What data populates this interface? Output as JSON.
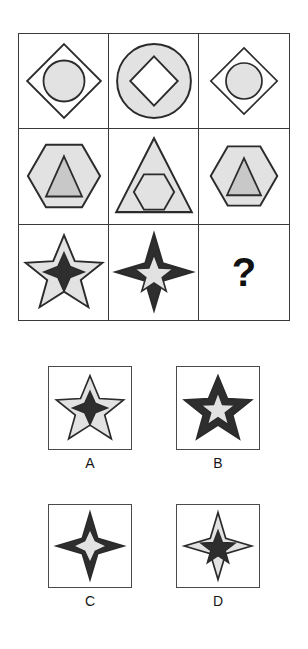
{
  "puzzle": {
    "type": "visual-analogy-matrix",
    "question_mark": "?",
    "palette": {
      "light_fill": "#e2e2e2",
      "mid_fill": "#c8c8c8",
      "dark_fill": "#2e2e2e",
      "white_fill": "#ffffff",
      "outline": "#2b2b2b",
      "grid_border": "#3a3a3a",
      "box_border": "#4a4a4a",
      "background": "#ffffff"
    },
    "matrix": {
      "rows": 3,
      "cols": 3,
      "cells": [
        {
          "id": "r1c1",
          "outer_shape": "diamond",
          "outer_fill": "white",
          "inner_shape": "circle",
          "inner_fill": "light",
          "size": "large",
          "description": "Large white diamond containing a light gray circle"
        },
        {
          "id": "r1c2",
          "outer_shape": "circle",
          "outer_fill": "light",
          "inner_shape": "diamond",
          "inner_fill": "white",
          "size": "large",
          "description": "Light gray circle containing a white diamond"
        },
        {
          "id": "r1c3",
          "outer_shape": "diamond",
          "outer_fill": "white",
          "inner_shape": "circle",
          "inner_fill": "light",
          "size": "medium",
          "description": "White diamond containing a light gray circle"
        },
        {
          "id": "r2c1",
          "outer_shape": "hexagon",
          "outer_fill": "light",
          "inner_shape": "triangle",
          "inner_fill": "mid",
          "size": "large",
          "description": "Light gray hexagon containing a gray triangle"
        },
        {
          "id": "r2c2",
          "outer_shape": "triangle",
          "outer_fill": "light",
          "inner_shape": "hexagon",
          "inner_fill": "light",
          "size": "large",
          "description": "Light gray triangle containing a light gray hexagon"
        },
        {
          "id": "r2c3",
          "outer_shape": "hexagon",
          "outer_fill": "light",
          "inner_shape": "triangle",
          "inner_fill": "mid",
          "size": "medium",
          "description": "Light gray hexagon containing a gray triangle"
        },
        {
          "id": "r3c1",
          "outer_shape": "star5",
          "outer_fill": "light",
          "inner_shape": "star4",
          "inner_fill": "dark",
          "size": "large",
          "description": "Light gray five-point star containing a dark four-point star"
        },
        {
          "id": "r3c2",
          "outer_shape": "star4",
          "outer_fill": "dark",
          "inner_shape": "star5",
          "inner_fill": "light",
          "size": "large",
          "description": "Dark four-point star containing a light gray five-point star"
        },
        {
          "id": "r3c3",
          "outer_shape": "question",
          "outer_fill": "none",
          "inner_shape": "none",
          "inner_fill": "none",
          "size": "medium",
          "description": "Missing tile marked with a question mark"
        }
      ]
    },
    "options": [
      {
        "id": "A",
        "label": "A",
        "outer_shape": "star5",
        "outer_fill": "light",
        "inner_shape": "star4",
        "inner_fill": "dark",
        "description": "Light gray five-point star containing a dark four-point star"
      },
      {
        "id": "B",
        "label": "B",
        "outer_shape": "star5",
        "outer_fill": "dark",
        "inner_shape": "star5",
        "inner_fill": "light",
        "description": "Dark five-point star containing a light gray five-point star"
      },
      {
        "id": "C",
        "label": "C",
        "outer_shape": "star4",
        "outer_fill": "dark",
        "inner_shape": "star4",
        "inner_fill": "light",
        "description": "Dark four-point star containing a light gray four-point star"
      },
      {
        "id": "D",
        "label": "D",
        "outer_shape": "star4",
        "outer_fill": "light",
        "inner_shape": "star5",
        "inner_fill": "dark",
        "description": "Light gray four-point star containing a dark five-point star"
      }
    ]
  }
}
